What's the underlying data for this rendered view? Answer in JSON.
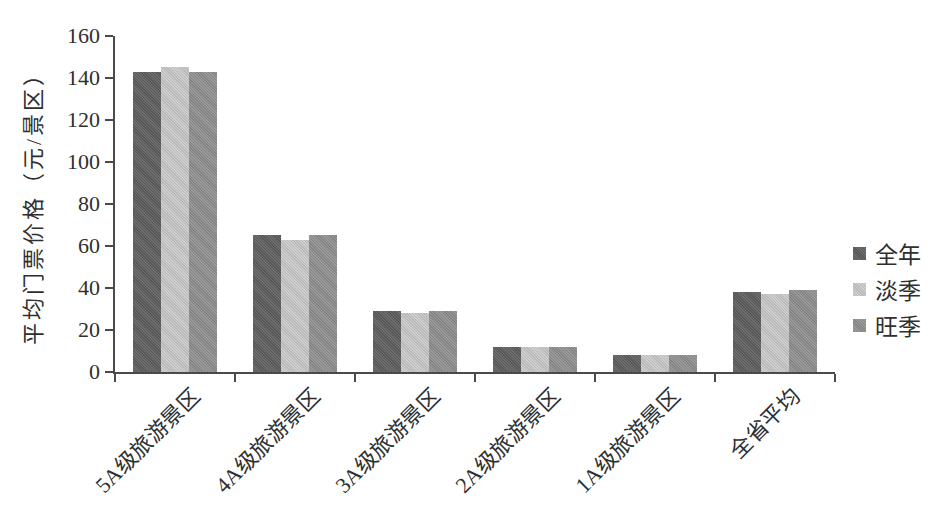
{
  "chart_data": {
    "type": "bar",
    "title": "",
    "xlabel": "",
    "ylabel": "平均门票价格（元/景区）",
    "ylim": [
      0,
      160
    ],
    "yticks": [
      0,
      20,
      40,
      60,
      80,
      100,
      120,
      140,
      160
    ],
    "grid": false,
    "legend_position": "right",
    "categories": [
      "5A级旅游景区",
      "4A级旅游景区",
      "3A级旅游景区",
      "2A级旅游景区",
      "1A级旅游景区",
      "全省平均"
    ],
    "series": [
      {
        "name": "全年",
        "color": "#5e5e5e",
        "values": [
          143,
          65,
          29,
          12,
          8,
          38
        ]
      },
      {
        "name": "淡季",
        "color": "#c9c9c9",
        "values": [
          145,
          63,
          28,
          12,
          8,
          37
        ]
      },
      {
        "name": "旺季",
        "color": "#8f8f8f",
        "values": [
          143,
          65,
          29,
          12,
          8,
          39
        ]
      }
    ]
  },
  "colors": {
    "axis": "#4a4a4a",
    "text": "#2f2f2f",
    "background": "#ffffff"
  }
}
